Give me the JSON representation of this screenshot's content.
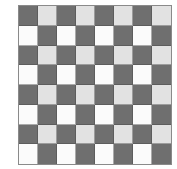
{
  "board": {
    "rows": 8,
    "cols": 8,
    "colors": {
      "dark": "#6f6f6f",
      "lightgray": "#e2e2e2",
      "white": "#fbfbfb",
      "gridline": "#8a8a8a"
    },
    "cells": [
      [
        "dark",
        "lightgray",
        "dark",
        "lightgray",
        "dark",
        "lightgray",
        "dark",
        "lightgray"
      ],
      [
        "white",
        "dark",
        "white",
        "dark",
        "white",
        "dark",
        "white",
        "dark"
      ],
      [
        "dark",
        "lightgray",
        "dark",
        "lightgray",
        "dark",
        "lightgray",
        "dark",
        "lightgray"
      ],
      [
        "white",
        "dark",
        "white",
        "dark",
        "white",
        "dark",
        "white",
        "dark"
      ],
      [
        "dark",
        "lightgray",
        "dark",
        "lightgray",
        "dark",
        "lightgray",
        "dark",
        "lightgray"
      ],
      [
        "white",
        "dark",
        "white",
        "dark",
        "white",
        "dark",
        "white",
        "dark"
      ],
      [
        "dark",
        "lightgray",
        "dark",
        "lightgray",
        "dark",
        "lightgray",
        "dark",
        "lightgray"
      ],
      [
        "white",
        "dark",
        "white",
        "dark",
        "white",
        "dark",
        "white",
        "dark"
      ]
    ]
  }
}
